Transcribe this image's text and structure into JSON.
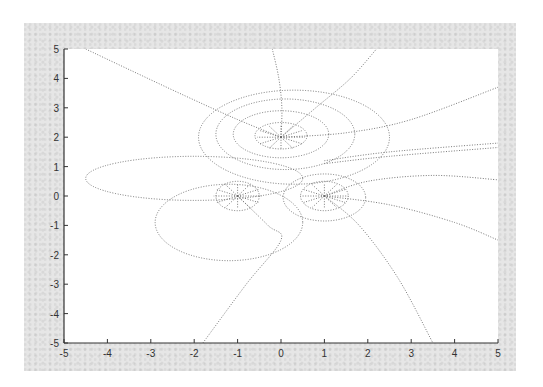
{
  "chart_data": {
    "type": "line",
    "title": "",
    "xlabel": "",
    "ylabel": "",
    "xlim": [
      -5,
      5
    ],
    "ylim": [
      -5,
      5
    ],
    "x_ticks": [
      "-5",
      "-4",
      "-3",
      "-2",
      "-1",
      "0",
      "1",
      "2",
      "3",
      "4",
      "5"
    ],
    "y_ticks": [
      "5",
      "4",
      "3",
      "2",
      "1",
      "0",
      "-1",
      "-2",
      "-3",
      "-4",
      "-5"
    ],
    "grid": false,
    "legend": null,
    "line_style": "dotted",
    "line_color": "#6a6a6a",
    "sources": [
      {
        "x": 0,
        "y": 2
      },
      {
        "x": -1,
        "y": 0
      },
      {
        "x": 1,
        "y": 0
      }
    ],
    "field_lines": [
      {
        "name": "top-left to upper-left",
        "points": [
          [
            0,
            2
          ],
          [
            -1,
            2.6
          ],
          [
            -2.2,
            3.4
          ],
          [
            -3.5,
            4.3
          ],
          [
            -4.5,
            5
          ]
        ]
      },
      {
        "name": "top source upward",
        "points": [
          [
            0,
            2
          ],
          [
            0.02,
            3
          ],
          [
            -0.05,
            4
          ],
          [
            -0.2,
            5
          ]
        ]
      },
      {
        "name": "top source up-right",
        "points": [
          [
            0,
            2
          ],
          [
            0.8,
            3
          ],
          [
            1.6,
            4
          ],
          [
            2.2,
            5
          ]
        ]
      },
      {
        "name": "top source right",
        "points": [
          [
            0,
            2
          ],
          [
            1.5,
            2.15
          ],
          [
            3,
            2.6
          ],
          [
            5,
            3.7
          ]
        ]
      },
      {
        "name": "right source far right 1",
        "points": [
          [
            1,
            0
          ],
          [
            2,
            0.5
          ],
          [
            3.5,
            0.7
          ],
          [
            5,
            0.55
          ]
        ]
      },
      {
        "name": "right source far right 2",
        "points": [
          [
            1,
            0
          ],
          [
            2.5,
            -0.3
          ],
          [
            4,
            -0.9
          ],
          [
            5,
            -1.5
          ]
        ]
      },
      {
        "name": "right source down-right",
        "points": [
          [
            1,
            0
          ],
          [
            1.8,
            -1
          ],
          [
            2.7,
            -2.8
          ],
          [
            3.5,
            -5
          ]
        ]
      },
      {
        "name": "left source down-left",
        "points": [
          [
            -1,
            0
          ],
          [
            -0.3,
            -1
          ],
          [
            0,
            -1.5
          ],
          [
            -0.8,
            -3
          ],
          [
            -1.8,
            -5
          ]
        ]
      },
      {
        "name": "right band 1",
        "points": [
          [
            1,
            1.2
          ],
          [
            2.5,
            1.5
          ],
          [
            5,
            1.8
          ]
        ]
      },
      {
        "name": "right band 2",
        "points": [
          [
            1,
            1.1
          ],
          [
            2.5,
            1.35
          ],
          [
            5,
            1.65
          ]
        ]
      }
    ],
    "equipotentials": [
      {
        "name": "outer top ring",
        "center": [
          0.3,
          2
        ],
        "rx": 2.2,
        "ry": 1.6
      },
      {
        "name": "top ring 2",
        "center": [
          0.1,
          2.1
        ],
        "rx": 1.6,
        "ry": 1.2
      },
      {
        "name": "top ring 3",
        "center": [
          0,
          2.1
        ],
        "rx": 1.1,
        "ry": 0.8
      },
      {
        "name": "top ring inner",
        "center": [
          0,
          2.05
        ],
        "rx": 0.6,
        "ry": 0.45
      },
      {
        "name": "left loop",
        "center": [
          -2,
          0.6
        ],
        "rx": 2.5,
        "ry": 0.75
      },
      {
        "name": "left-lower loop",
        "center": [
          -1.2,
          -0.9
        ],
        "rx": 1.7,
        "ry": 1.3
      },
      {
        "name": "left source ring",
        "center": [
          -1,
          0
        ],
        "rx": 0.5,
        "ry": 0.5
      },
      {
        "name": "right source ring",
        "center": [
          1,
          0
        ],
        "rx": 0.55,
        "ry": 0.5
      },
      {
        "name": "right source ring 2",
        "center": [
          1,
          -0.05
        ],
        "rx": 0.95,
        "ry": 0.8
      }
    ]
  }
}
